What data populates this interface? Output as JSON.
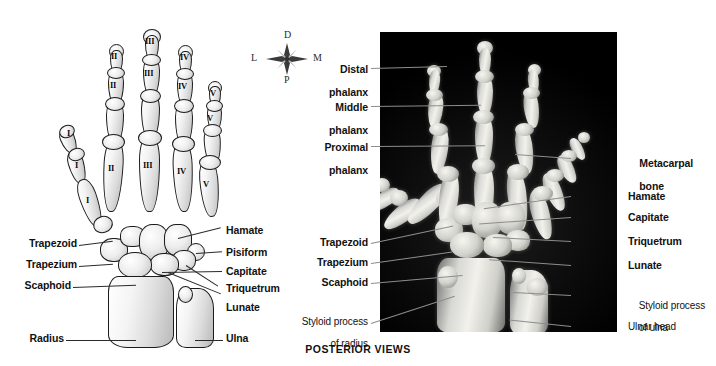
{
  "figure": {
    "caption": "POSTERIOR VIEWS",
    "background_color": "#ffffff",
    "xray_background_color": "#000000",
    "leader_line_color": "#4a4a4a"
  },
  "compass": {
    "name": "orientation-rose",
    "top": "D",
    "left": "L",
    "right": "M",
    "bottom": "P"
  },
  "drawing": {
    "name": "hand-skeleton-illustration",
    "digit_numerals": [
      "I",
      "II",
      "III",
      "IV",
      "V"
    ],
    "phalanx_numerals": {
      "thumb": [
        "I",
        "I"
      ],
      "index": [
        "II",
        "II",
        "II"
      ],
      "middle": [
        "III",
        "III",
        "III"
      ],
      "ring": [
        "IV",
        "IV",
        "IV"
      ],
      "little": [
        "V",
        "V",
        "V"
      ]
    },
    "metacarpal_numerals": [
      "I",
      "II",
      "III",
      "IV",
      "V"
    ],
    "labels_left": [
      {
        "text": "Trapezoid",
        "bold": true
      },
      {
        "text": "Trapezium",
        "bold": true
      },
      {
        "text": "Scaphoid",
        "bold": true
      },
      {
        "text": "Radius",
        "bold": true
      }
    ],
    "labels_right": [
      {
        "text": "Hamate",
        "bold": true
      },
      {
        "text": "Pisiform",
        "bold": true
      },
      {
        "text": "Capitate",
        "bold": true
      },
      {
        "text": "Triquetrum",
        "bold": true
      },
      {
        "text": "Lunate",
        "bold": true
      },
      {
        "text": "Ulna",
        "bold": true
      }
    ]
  },
  "xray": {
    "name": "hand-radiograph",
    "labels_left": [
      {
        "line1": "Distal",
        "line2": "phalanx",
        "bold": true
      },
      {
        "line1": "Middle",
        "line2": "phalanx",
        "bold": true
      },
      {
        "line1": "Proximal",
        "line2": "phalanx",
        "bold": true
      },
      {
        "line1": "Trapezoid",
        "line2": "",
        "bold": true
      },
      {
        "line1": "Trapezium",
        "line2": "",
        "bold": true
      },
      {
        "line1": "Scaphoid",
        "line2": "",
        "bold": true
      },
      {
        "line1": "Styloid process",
        "line2": "of radius",
        "bold": false
      }
    ],
    "labels_right": [
      {
        "line1": "Metacarpal",
        "line2": "bone",
        "bold": true
      },
      {
        "line1": "Hamate",
        "line2": "",
        "bold": true
      },
      {
        "line1": "Capitate",
        "line2": "",
        "bold": true
      },
      {
        "line1": "Triquetrum",
        "line2": "",
        "bold": true
      },
      {
        "line1": "Lunate",
        "line2": "",
        "bold": true
      },
      {
        "line1": "Styloid process",
        "line2": "of ulna",
        "bold": false
      },
      {
        "line1": "Ulnar head",
        "line2": "",
        "bold": false
      }
    ]
  }
}
